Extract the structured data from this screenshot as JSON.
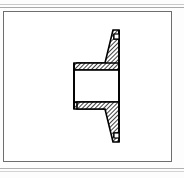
{
  "page": {
    "width": 184,
    "height": 178,
    "background_color": "#fdfdfd",
    "document_type": "engineering-drawing-scan"
  },
  "scan_artifacts": {
    "top_band_label": "scan edge band top",
    "bottom_band_label": "scan edge band bottom",
    "color": "#b9b9b9"
  },
  "sheet": {
    "frame_label": "drawing border",
    "frame_color": "#6e6e6e",
    "fill_color": "#ffffff",
    "x": 3,
    "y": 11,
    "width": 169,
    "height": 151
  },
  "drawing": {
    "title": "Flanged hub cross-section",
    "view_type": "full section",
    "projection": "side sectional view",
    "outline_color": "#000000",
    "hatch_color": "#000000",
    "hatch_angle_deg": 45,
    "hatch_spacing_px": 2,
    "bore_fill": "#ffffff",
    "symmetry": "horizontal centerline, vertically symmetric",
    "features": [
      {
        "name": "flange-plate",
        "description": "tall vertical plate on right side of section, hatched"
      },
      {
        "name": "hub-boss",
        "description": "cylindrical boss projecting left from the flange, hatched walls"
      },
      {
        "name": "bore",
        "description": "central unhatched through bore running horizontally"
      },
      {
        "name": "top-relief-notch",
        "description": "small rectangular relief groove at top outer edge of flange"
      },
      {
        "name": "bottom-relief-notch",
        "description": "small rectangular relief groove at bottom outer edge of flange"
      },
      {
        "name": "taper-web",
        "description": "tapered web joining hub to flange rim, upper and lower"
      }
    ],
    "geometry": {
      "part_left_px": 73,
      "part_right_px": 118,
      "part_top_px": 28,
      "part_bottom_px": 142,
      "bore_top_px": 69,
      "bore_bottom_px": 101,
      "bore_left_px": 76,
      "hub_left_px": 73,
      "flange_right_px": 118
    }
  }
}
